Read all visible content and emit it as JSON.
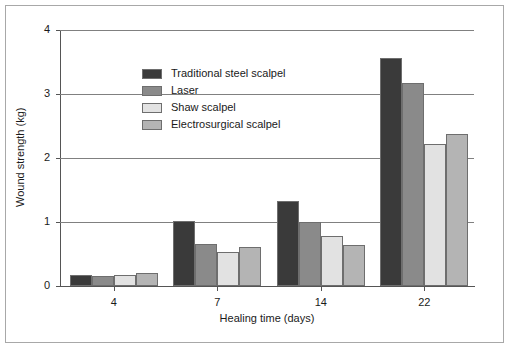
{
  "chart_data": {
    "type": "bar",
    "title": "",
    "xlabel": "Healing time (days)",
    "ylabel": "Wound strength (kg)",
    "categories": [
      "4",
      "7",
      "14",
      "22"
    ],
    "ylim": [
      0,
      4
    ],
    "yticks": [
      "0",
      "1",
      "2",
      "3",
      "4"
    ],
    "grid": "horizontal",
    "legend_position": "top-left inside plot",
    "series": [
      {
        "name": "Traditional steel scalpel",
        "color": "#3a3a3a",
        "values": [
          0.17,
          1.02,
          1.33,
          3.57
        ]
      },
      {
        "name": "Laser",
        "color": "#8a8a8a",
        "values": [
          0.16,
          0.66,
          1.0,
          3.17
        ]
      },
      {
        "name": "Shaw scalpel",
        "color": "#e2e2e2",
        "values": [
          0.17,
          0.53,
          0.78,
          2.22
        ]
      },
      {
        "name": "Electrosurgical scalpel",
        "color": "#b4b4b4",
        "values": [
          0.2,
          0.61,
          0.64,
          2.38
        ]
      }
    ]
  },
  "figure": {
    "frame_color": "#a8a8a8",
    "background": "#ffffff",
    "axis_color": "#555555",
    "grid_color": "#808080",
    "bar_border_color": "#6e6e6e"
  }
}
